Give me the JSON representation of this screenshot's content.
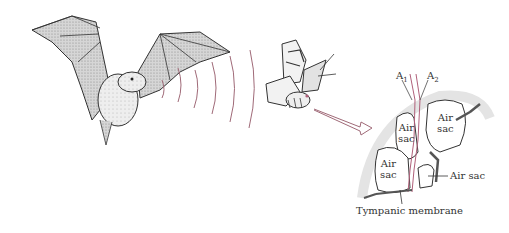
{
  "diagram": {
    "subjects": {
      "bat": "bat",
      "moth": "moth",
      "ear_detail": "moth tympanic ear cross-section"
    },
    "labels": {
      "a1_main": "A",
      "a1_sub": "1",
      "a2_main": "A",
      "a2_sub": "2",
      "air_sac_top_left_1": "Air",
      "air_sac_top_left_2": "sac",
      "air_sac_top_right_1": "Air",
      "air_sac_top_right_2": "sac",
      "air_sac_bottom_left_1": "Air",
      "air_sac_bottom_left_2": "sac",
      "air_sac_callout": "Air sac",
      "tympanic_membrane": "Tympanic membrane"
    },
    "colors": {
      "sound_waves": "#a06a78",
      "nerve": "#b0607a",
      "ink": "#333333",
      "wing_shade": "#c8c8c8"
    },
    "sound_wave_count": 6
  }
}
